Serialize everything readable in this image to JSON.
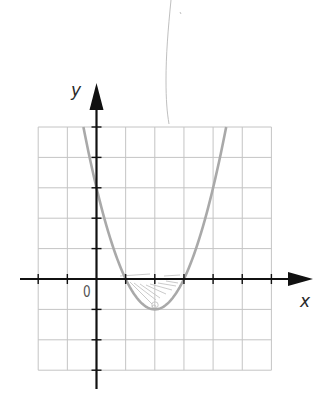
{
  "figure": {
    "y_axis_label": "y",
    "x_axis_label": "x",
    "origin_label": "0",
    "colors": {
      "grid": "#c4c4c4",
      "axis": "#111111",
      "curve": "#a9a9a9",
      "pencil": "#b8b8b8"
    }
  },
  "chart_data": {
    "type": "line",
    "title": "",
    "xlabel": "x",
    "ylabel": "y",
    "function": "y = x^2 - 4x + 3 = (x-1)(x-3)",
    "coefficients": {
      "a": 1,
      "b": -4,
      "c": 3
    },
    "x_range_drawn": [
      -0.449,
      4.449
    ],
    "grid": true,
    "xlim": [
      -2,
      6
    ],
    "ylim": [
      -3,
      5
    ],
    "grid_step": 1,
    "key_points": {
      "roots": [
        [
          1,
          0
        ],
        [
          3,
          0
        ]
      ],
      "vertex": [
        2,
        -1
      ],
      "y_intercept": [
        0,
        3
      ]
    },
    "annotations": [
      "hand-drawn shading between the curve and the x-axis for 1 < x < 3",
      "pencil mark at the vertex"
    ]
  }
}
